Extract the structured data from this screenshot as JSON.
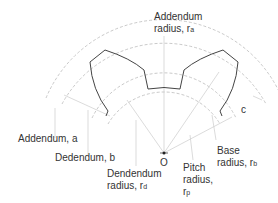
{
  "diagram": {
    "center_label": "O",
    "labels": {
      "addendum_radius": {
        "line1": "Addendum",
        "line2": "radius, r",
        "sub": "a"
      },
      "addendum": "Addendum, a",
      "dedendum": "Dedendum, b",
      "dedendum_radius": {
        "line1": "Dendendum",
        "line2": "radius, r",
        "sub": "d"
      },
      "pitch_radius": {
        "line1": "Pitch",
        "line2": "radius,",
        "line3": "r",
        "sub": "p"
      },
      "base_radius": {
        "line1": "Base",
        "line2": "radius, r",
        "sub": "b"
      },
      "clearance": "c"
    },
    "colors": {
      "tooth_outline": "#444444",
      "circles": "#bbbbbb",
      "leader_lines": "#cccccc",
      "text": "#333333"
    }
  }
}
